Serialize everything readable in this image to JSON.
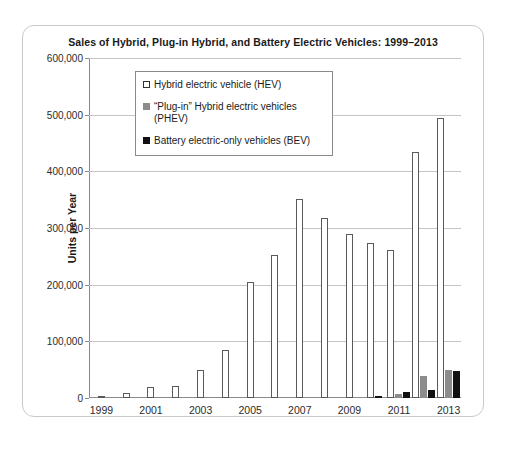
{
  "chart_data": {
    "type": "bar",
    "title": "Sales of Hybrid, Plug-in Hybrid, and Battery Electric Vehicles: 1999–2013",
    "xlabel": "",
    "ylabel": "Units per Year",
    "ylim": [
      0,
      600000
    ],
    "ytick_labels": [
      "0",
      "100,000",
      "200,000",
      "300,000",
      "400,000",
      "500,000",
      "600,000"
    ],
    "ytick_values": [
      0,
      100000,
      200000,
      300000,
      400000,
      500000,
      600000
    ],
    "grid": true,
    "legend_position": "upper-left-inside",
    "categories": [
      1999,
      2000,
      2001,
      2002,
      2003,
      2004,
      2005,
      2006,
      2007,
      2008,
      2009,
      2010,
      2011,
      2012,
      2013
    ],
    "xtick_labels": [
      "1999",
      "",
      "2001",
      "",
      "2003",
      "",
      "2005",
      "",
      "2007",
      "",
      "2009",
      "",
      "2011",
      "",
      "2013"
    ],
    "series": [
      {
        "name": "Hybrid electric vehicle (HEV)",
        "color": "#ffffff",
        "edge_color": "#5a5a5a",
        "values": [
          2000,
          9350,
          20280,
          21000,
          50000,
          85000,
          205000,
          253000,
          352000,
          317000,
          290000,
          274000,
          262000,
          434000,
          495000
        ]
      },
      {
        "name": "“Plug-in” Hybrid electric vehicles (PHEV)",
        "color": "#8c8c8c",
        "edge_color": "#8c8c8c",
        "values": [
          0,
          0,
          0,
          0,
          0,
          0,
          0,
          0,
          0,
          0,
          0,
          0,
          7700,
          38500,
          49000
        ]
      },
      {
        "name": "Battery electric-only vehicles (BEV)",
        "color": "#111111",
        "edge_color": "#111111",
        "values": [
          0,
          0,
          0,
          0,
          0,
          0,
          0,
          0,
          0,
          0,
          0,
          1200,
          10000,
          14200,
          48000
        ]
      }
    ]
  },
  "legend": {
    "items": [
      {
        "label": "Hybrid electric vehicle (HEV)",
        "swatch": "hev"
      },
      {
        "label": "“Plug-in” Hybrid electric vehicles (PHEV)",
        "swatch": "phev"
      },
      {
        "label": "Battery electric-only vehicles (BEV)",
        "swatch": "bev"
      }
    ]
  }
}
